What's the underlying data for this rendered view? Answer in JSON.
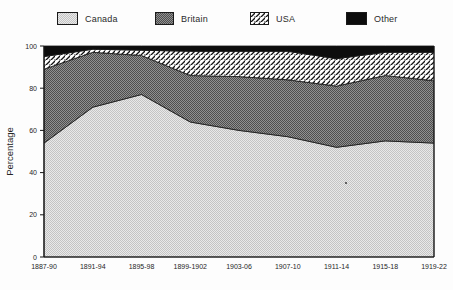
{
  "chart_data": {
    "type": "area",
    "stacked": true,
    "title": "",
    "categories": [
      "1887-90",
      "1891-94",
      "1895-98",
      "1899-1902",
      "1903-06",
      "1907-10",
      "1911-14",
      "1915-18",
      "1919-22"
    ],
    "series": [
      {
        "name": "Canada",
        "pattern": "stipple-light",
        "values": [
          54,
          71,
          77,
          64,
          60,
          57,
          52,
          55,
          54
        ]
      },
      {
        "name": "Britain",
        "pattern": "stipple-dark",
        "values": [
          35,
          26,
          18.5,
          22,
          25.5,
          27,
          29,
          31,
          29.5
        ]
      },
      {
        "name": "USA",
        "pattern": "diagonal-hatch",
        "values": [
          6,
          1.5,
          2.5,
          11.5,
          12,
          13.5,
          13,
          11,
          13.5
        ]
      },
      {
        "name": "Other",
        "pattern": "solid-black",
        "values": [
          5,
          1.5,
          2,
          2.5,
          2.5,
          2.5,
          6,
          3,
          3
        ]
      }
    ],
    "xlabel": "",
    "ylabel": "Percentage",
    "ylim": [
      0,
      100
    ],
    "yticks": [
      0,
      20,
      40,
      60,
      80,
      100
    ],
    "grid": false,
    "legend_position": "top"
  },
  "legend": {
    "items": [
      {
        "label": "Canada"
      },
      {
        "label": "Britain"
      },
      {
        "label": "USA"
      },
      {
        "label": "Other"
      }
    ]
  },
  "colors": {
    "light_fill": "#e9e9e9",
    "light_dot": "#c4c4c4",
    "dark_fill": "#909090",
    "dark_dot": "#4e4e4e",
    "hatch_bg": "#ffffff",
    "hatch_line": "#121212",
    "solid_black": "#0d0d0d",
    "axis": "#151515",
    "text": "#262626"
  },
  "artifacts": {
    "speck": {
      "x": 346,
      "y": 183
    }
  }
}
